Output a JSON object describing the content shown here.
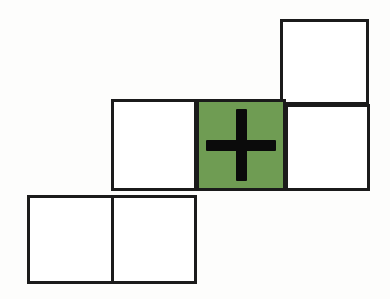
{
  "canvas": {
    "width": 390,
    "height": 299,
    "background_color": "#fdfdfc",
    "description": "Staircase arrangement of six outlined squares with one green highlighted square containing a plus sign"
  },
  "style": {
    "square_fill": "#ffffff",
    "square_border_color": "#1b1b1b",
    "square_border_width": 3,
    "highlight_fill": "#6f9c53",
    "plus_color": "#0b0b0b",
    "plus_stroke_width": 11
  },
  "grid": {
    "cell_size": 88,
    "row_count": 3,
    "total_cells": 6,
    "highlighted_cell_index": 3,
    "plus_cell_index": 3
  },
  "cells": [
    {
      "id": "cell-r1-c4",
      "label": "top-right square",
      "row": 1,
      "column": 4,
      "x": 280,
      "y": 19,
      "width": 89,
      "height": 86,
      "filled": false,
      "has_plus": false
    },
    {
      "id": "cell-r2-c2",
      "label": "middle-left square",
      "row": 2,
      "column": 2,
      "x": 111,
      "y": 99,
      "width": 86,
      "height": 92,
      "filled": false,
      "has_plus": false
    },
    {
      "id": "cell-r2-c3",
      "label": "middle-center green square with plus",
      "row": 2,
      "column": 3,
      "x": 196,
      "y": 99,
      "width": 90,
      "height": 92,
      "filled": true,
      "has_plus": true
    },
    {
      "id": "cell-r2-c4",
      "label": "middle-right square",
      "row": 2,
      "column": 4,
      "x": 285,
      "y": 104,
      "width": 85,
      "height": 87,
      "filled": false,
      "has_plus": false
    },
    {
      "id": "cell-r3-c1",
      "label": "bottom-left square",
      "row": 3,
      "column": 1,
      "x": 27,
      "y": 195,
      "width": 88,
      "height": 89,
      "filled": false,
      "has_plus": false
    },
    {
      "id": "cell-r3-c2",
      "label": "bottom-center square",
      "row": 3,
      "column": 2,
      "x": 111,
      "y": 195,
      "width": 86,
      "height": 89,
      "filled": false,
      "has_plus": false
    }
  ],
  "plus_icon": {
    "name": "plus-icon",
    "glyph": "+",
    "color": "#0b0b0b",
    "center_x": 240,
    "center_y": 145,
    "arm_length": 75,
    "stroke_width": 11
  }
}
